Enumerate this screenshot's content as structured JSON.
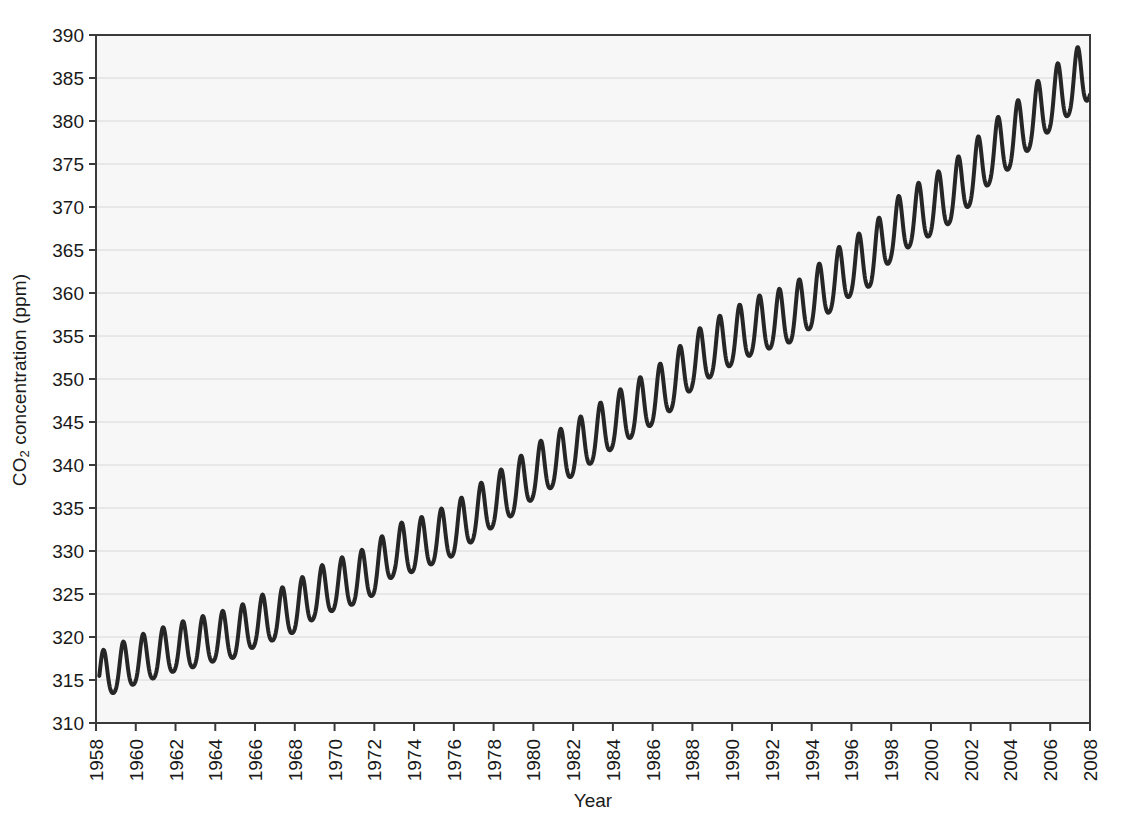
{
  "chart_data": {
    "type": "line",
    "title": "",
    "xlabel": "Year",
    "ylabel": "CO2 concentration (ppm)",
    "ylabel_rich": {
      "prefix": "CO",
      "sub": "2",
      "suffix": " concentration (ppm)"
    },
    "xlim": [
      1958,
      2008
    ],
    "ylim": [
      310,
      390
    ],
    "ytick_step": 5,
    "xtick_step": 2,
    "grid": "horizontal",
    "legend": "none",
    "xticklabels": [
      "1958",
      "1960",
      "1962",
      "1964",
      "1966",
      "1968",
      "1970",
      "1972",
      "1974",
      "1976",
      "1978",
      "1980",
      "1982",
      "1984",
      "1986",
      "1988",
      "1990",
      "1992",
      "1994",
      "1996",
      "1998",
      "2000",
      "2002",
      "2004",
      "2006",
      "2008"
    ],
    "yticklabels": [
      "310",
      "315",
      "320",
      "325",
      "330",
      "335",
      "340",
      "345",
      "350",
      "355",
      "360",
      "365",
      "370",
      "375",
      "380",
      "385",
      "390"
    ],
    "series": [
      {
        "name": "Atmospheric CO2 (Mauna Loa monthly mean)",
        "color": "#262626",
        "line_width": 4,
        "seasonal_amplitude_ppm": 3.2,
        "seasonal_peak_month": 5,
        "annual_means": {
          "1958": 315.0,
          "1959": 315.9,
          "1960": 316.9,
          "1961": 317.6,
          "1962": 318.4,
          "1963": 318.9,
          "1964": 319.6,
          "1965": 320.0,
          "1966": 321.3,
          "1967": 322.1,
          "1968": 323.0,
          "1969": 324.6,
          "1970": 325.6,
          "1971": 326.3,
          "1972": 327.4,
          "1973": 329.7,
          "1974": 330.1,
          "1975": 331.1,
          "1976": 332.0,
          "1977": 333.8,
          "1978": 335.4,
          "1979": 336.8,
          "1980": 338.7,
          "1981": 340.1,
          "1982": 341.4,
          "1983": 343.0,
          "1984": 344.6,
          "1985": 346.0,
          "1986": 347.4,
          "1987": 349.2,
          "1988": 351.6,
          "1989": 353.1,
          "1990": 354.4,
          "1991": 355.6,
          "1992": 356.4,
          "1993": 357.1,
          "1994": 358.8,
          "1995": 360.8,
          "1996": 362.6,
          "1997": 363.7,
          "1998": 366.7,
          "1999": 368.4,
          "2000": 369.6,
          "2001": 371.1,
          "2002": 373.2,
          "2003": 375.8,
          "2004": 377.5,
          "2005": 379.8,
          "2006": 381.9,
          "2007": 383.8,
          "2008": 385.6
        }
      }
    ]
  },
  "axes": {
    "plot_background": "#f7f7f7",
    "border_color": "#3a3a3a",
    "gridline_color": "#d8d8d8",
    "tick_color": "#3a3a3a"
  }
}
